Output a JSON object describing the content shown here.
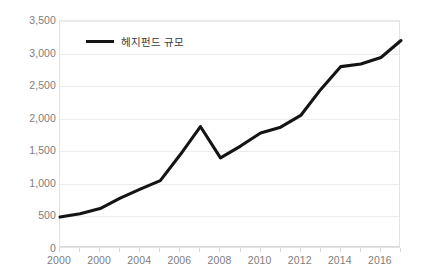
{
  "chart_data": {
    "type": "line",
    "title": "",
    "xlabel": "",
    "ylabel": "",
    "grid": true,
    "legend_position": "top-left",
    "xlim": [
      2000,
      2017
    ],
    "ylim": [
      0,
      3500
    ],
    "y_ticks": [
      0,
      500,
      1000,
      1500,
      2000,
      2500,
      3000,
      3500
    ],
    "y_tick_labels": [
      "0",
      "500",
      "1,000",
      "1,500",
      "2,000",
      "2,500",
      "3,000",
      "3,500"
    ],
    "x_ticks": [
      2000,
      2001,
      2002,
      2003,
      2004,
      2005,
      2006,
      2007,
      2008,
      2009,
      2010,
      2011,
      2012,
      2013,
      2014,
      2015,
      2016,
      2017
    ],
    "x_tick_labels": [
      "2000",
      "",
      "2000",
      "",
      "2004",
      "",
      "2006",
      "",
      "2008",
      "",
      "2010",
      "",
      "2012",
      "",
      "2014",
      "",
      "2016",
      ""
    ],
    "series": [
      {
        "name": "헤지펀드 규모",
        "color": "#141414",
        "x": [
          2000,
          2001,
          2002,
          2003,
          2004,
          2005,
          2006,
          2007,
          2008,
          2009,
          2010,
          2011,
          2012,
          2013,
          2014,
          2015,
          2016,
          2017
        ],
        "values": [
          490,
          540,
          620,
          780,
          920,
          1050,
          1450,
          1880,
          1400,
          1580,
          1780,
          1870,
          2050,
          2450,
          2800,
          2840,
          2940,
          3200
        ]
      }
    ]
  },
  "legend": {
    "label": "헤지펀드 규모"
  }
}
